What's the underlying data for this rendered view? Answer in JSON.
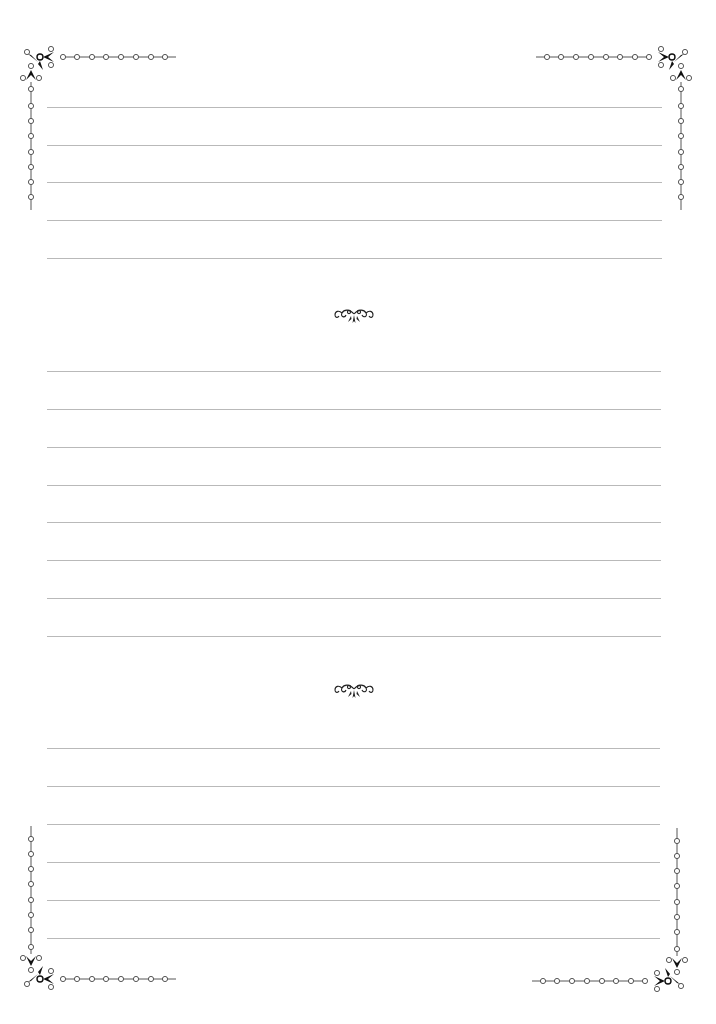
{
  "page": {
    "type": "lined stationery sheet",
    "background": "#ffffff",
    "rule_color": "#b9b9b9",
    "ornament_color": "#222222"
  },
  "sections": [
    {
      "name": "section-1",
      "line_count": 5,
      "lines_y": [
        107,
        145,
        182,
        220,
        258
      ]
    },
    {
      "name": "section-2",
      "line_count": 8,
      "lines_y": [
        371,
        409,
        447,
        485,
        522,
        560,
        598,
        636
      ]
    },
    {
      "name": "section-3",
      "line_count": 6,
      "lines_y": [
        748,
        786,
        824,
        862,
        900,
        938
      ]
    }
  ],
  "dividers": [
    {
      "name": "flourish-divider-1",
      "icon": "scroll-flourish-icon",
      "y": 315
    },
    {
      "name": "flourish-divider-2",
      "icon": "scroll-flourish-icon",
      "y": 690
    }
  ],
  "corners": [
    {
      "name": "corner-top-left",
      "icon": "beaded-corner-icon"
    },
    {
      "name": "corner-top-right",
      "icon": "beaded-corner-icon"
    },
    {
      "name": "corner-bottom-left",
      "icon": "beaded-corner-icon"
    },
    {
      "name": "corner-bottom-right",
      "icon": "beaded-corner-icon"
    }
  ]
}
